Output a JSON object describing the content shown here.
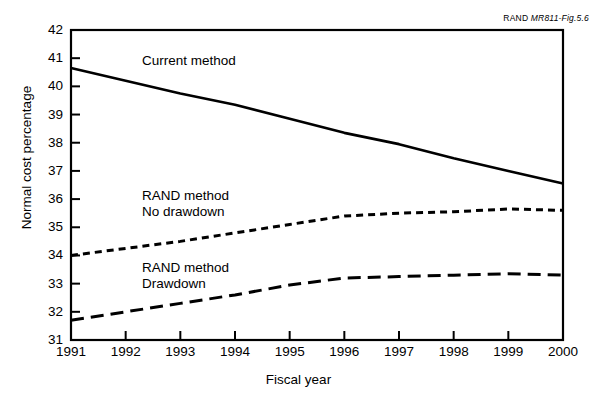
{
  "figure": {
    "source_note_prefix": "RAND ",
    "source_note_id": "MR811-Fig.5.6"
  },
  "chart_data": {
    "type": "line",
    "title": "",
    "xlabel": "Fiscal year",
    "ylabel": "Normal cost percentage",
    "x": [
      1991,
      1992,
      1993,
      1994,
      1995,
      1996,
      1997,
      1998,
      1999,
      2000
    ],
    "xtick_labels": [
      "1991",
      "1992",
      "1993",
      "1994",
      "1995",
      "1996",
      "1997",
      "1998",
      "1999",
      "2000"
    ],
    "ytick_labels": [
      "42",
      "41",
      "40",
      "39",
      "38",
      "37",
      "36",
      "35",
      "34",
      "33",
      "32",
      "31"
    ],
    "xlim": [
      1991,
      2000
    ],
    "ylim": [
      31,
      42
    ],
    "grid": false,
    "legend": "inline-annotations",
    "series": [
      {
        "name": "Current method",
        "style": "solid",
        "label_lines": [
          "Current method"
        ],
        "values": [
          40.65,
          40.2,
          39.75,
          39.35,
          38.85,
          38.35,
          37.95,
          37.45,
          37.0,
          36.55
        ]
      },
      {
        "name": "RAND method No drawdown",
        "style": "dotted",
        "label_lines": [
          "RAND method",
          "No drawdown"
        ],
        "values": [
          34.0,
          34.25,
          34.5,
          34.8,
          35.1,
          35.4,
          35.5,
          35.55,
          35.65,
          35.6
        ]
      },
      {
        "name": "RAND method Drawdown",
        "style": "dashed",
        "label_lines": [
          "RAND method",
          "Drawdown"
        ],
        "values": [
          31.7,
          32.0,
          32.3,
          32.6,
          32.95,
          33.2,
          33.25,
          33.3,
          33.35,
          33.3
        ]
      }
    ],
    "annotations": [
      {
        "text": "Current method",
        "x": 1992.3,
        "y": 40.9
      },
      {
        "text": "RAND method",
        "x": 1992.3,
        "y": 36.1
      },
      {
        "text": "No drawdown",
        "x": 1992.3,
        "y": 35.55
      },
      {
        "text": "RAND method",
        "x": 1992.3,
        "y": 33.55
      },
      {
        "text": "Drawdown",
        "x": 1992.3,
        "y": 33.0
      }
    ]
  },
  "colors": {
    "line": "#000000",
    "axis": "#000000",
    "background": "#ffffff"
  }
}
